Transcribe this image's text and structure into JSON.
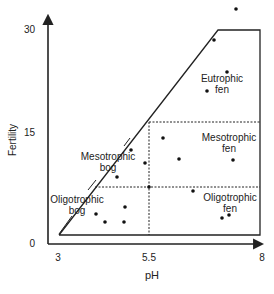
{
  "diagram": {
    "type": "region-diagram",
    "x_axis": {
      "label": "pH",
      "ticks": [
        "3",
        "5.5",
        "8"
      ],
      "range": [
        3,
        8
      ]
    },
    "y_axis": {
      "label": "Fertility",
      "ticks": [
        "0",
        "15",
        "30"
      ],
      "range": [
        0,
        30
      ]
    },
    "regions": [
      {
        "id": "eutrophic-fen",
        "line1": "Eutrophic",
        "line2": "fen"
      },
      {
        "id": "mesotrophic-fen",
        "line1": "Mesotrophic",
        "line2": "fen"
      },
      {
        "id": "oligotrophic-fen",
        "line1": "Oligotrophic",
        "line2": "fen"
      },
      {
        "id": "mesotrophic-bog",
        "line1": "Mesotrophic",
        "line2": "bog"
      },
      {
        "id": "oligotrophic-bog",
        "line1": "Oligotrophic",
        "line2": "bog"
      }
    ],
    "dividers": {
      "ph_split": 5.5
    },
    "colors": {
      "ink": "#222222",
      "background": "#ffffff"
    }
  },
  "chart_data": {
    "type": "scatter",
    "title": "",
    "xlabel": "pH",
    "ylabel": "Fertility",
    "xlim": [
      3,
      8
    ],
    "ylim": [
      0,
      30
    ],
    "x_ticks": [
      3,
      5.5,
      8
    ],
    "y_ticks": [
      0,
      15,
      30
    ],
    "points_px": [
      [
        236,
        9
      ],
      [
        214,
        40
      ],
      [
        227,
        72
      ],
      [
        207,
        91
      ],
      [
        163,
        138
      ],
      [
        179,
        159
      ],
      [
        233,
        160
      ],
      [
        131,
        150
      ],
      [
        145,
        163
      ],
      [
        117,
        177
      ],
      [
        149,
        187
      ],
      [
        193,
        191
      ],
      [
        222,
        218
      ],
      [
        229,
        215
      ],
      [
        96,
        214
      ],
      [
        105,
        222
      ],
      [
        125,
        207
      ],
      [
        124,
        222
      ]
    ],
    "legend": []
  }
}
